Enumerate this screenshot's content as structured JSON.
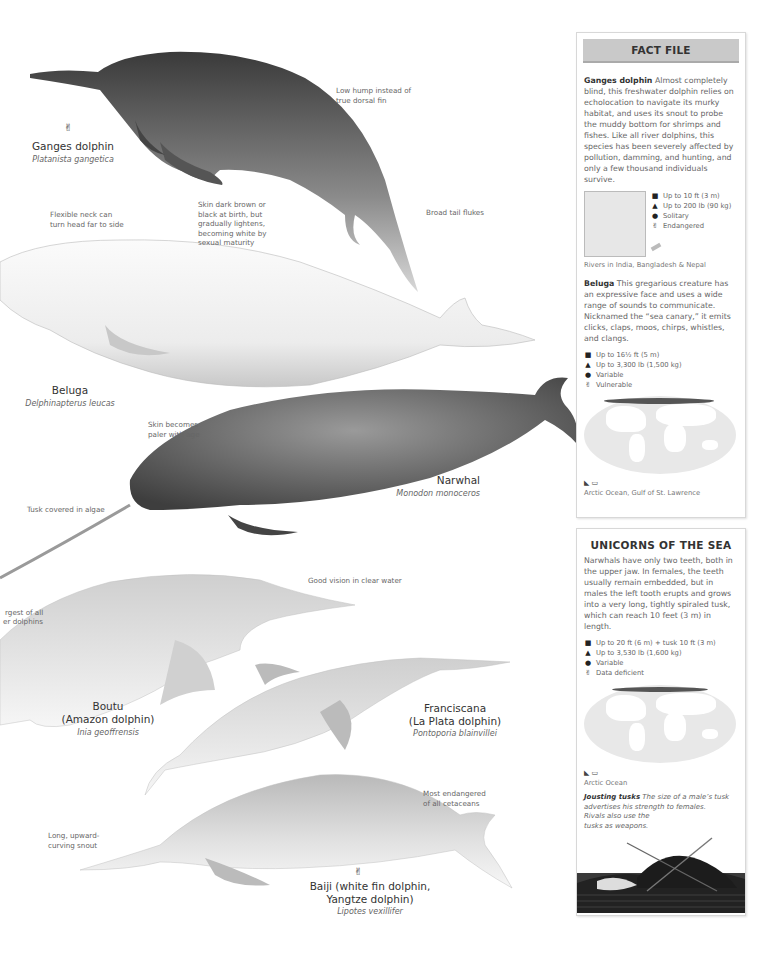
{
  "animals": {
    "ganges": {
      "common_name": "Ganges dolphin",
      "scientific_name": "Platanista gangetica",
      "status_icon": "endangered-icon",
      "annotations": [
        "Low hump instead of true dorsal fin",
        "Broad tail flukes"
      ]
    },
    "beluga": {
      "common_name": "Beluga",
      "scientific_name": "Delphinapterus leucas",
      "annotations": [
        "Flexible neck can turn head far to side",
        "Skin dark brown or black at birth, but gradually lightens, becoming white by sexual maturity"
      ]
    },
    "narwhal": {
      "common_name": "Narwhal",
      "scientific_name": "Monodon monoceros",
      "annotations": [
        "Skin becomes paler with age",
        "Tusk covered in algae"
      ]
    },
    "boutu": {
      "common_name_line1": "Boutu",
      "common_name_line2": "(Amazon dolphin)",
      "scientific_name": "Inia geoffrensis",
      "annotations": [
        "rgest of all",
        "er dolphins",
        "Good vision in clear water"
      ]
    },
    "franciscana": {
      "common_name_line1": "Franciscana",
      "common_name_line2": "(La Plata dolphin)",
      "scientific_name": "Pontoporia blainvillei"
    },
    "baiji": {
      "common_name_line1": "Baiji (white fin dolphin,",
      "common_name_line2": "Yangtze dolphin)",
      "scientific_name": "Lipotes vexillifer",
      "status_icon": "endangered-icon",
      "annotations": [
        "Most endangered of all cetaceans",
        "Long, upward-curving snout"
      ]
    }
  },
  "fact_file": {
    "title": "FACT FILE",
    "ganges": {
      "name": "Ganges dolphin",
      "text": "Almost completely blind, this freshwater dolphin relies on echolocation to navigate its murky habitat, and uses its snout to probe the muddy bottom for shrimps and fishes. Like all river dolphins, this species has been severely affected by pollution, damming, and hunting, and only a few thousand individuals survive.",
      "facts": [
        {
          "icon": "length-icon",
          "text": "Up to 10 ft (3 m)"
        },
        {
          "icon": "weight-icon",
          "text": "Up to 200 lb (90 kg)"
        },
        {
          "icon": "group-icon",
          "text": "Solitary"
        },
        {
          "icon": "status-icon",
          "text": "Endangered"
        }
      ],
      "range": "Rivers in India, Bangladesh & Nepal"
    },
    "beluga": {
      "name": "Beluga",
      "text": "This gregarious creature has an expressive face and uses a wide range of sounds to communicate. Nicknamed the “sea canary,” it emits clicks, claps, moos, chirps, whistles, and clangs.",
      "facts": [
        {
          "icon": "length-icon",
          "text": "Up to 16½ ft (5 m)"
        },
        {
          "icon": "weight-icon",
          "text": "Up to 3,300 lb (1,500 kg)"
        },
        {
          "icon": "group-icon",
          "text": "Variable"
        },
        {
          "icon": "status-icon",
          "text": "Vulnerable"
        }
      ],
      "range": "Arctic Ocean, Gulf of St. Lawrence"
    }
  },
  "unicorns": {
    "title": "UNICORNS OF THE SEA",
    "text": "Narwhals have only two teeth, both in the upper jaw. In females, the teeth usually remain embedded, but in males the left tooth erupts and grows into a very long, tightly spiraled tusk, which can reach 10 feet (3 m) in length.",
    "facts": [
      {
        "icon": "length-icon",
        "text": "Up to 20 ft (6 m) + tusk 10 ft (3 m)"
      },
      {
        "icon": "weight-icon",
        "text": "Up to 3,530 lb (1,600 kg)"
      },
      {
        "icon": "group-icon",
        "text": "Variable"
      },
      {
        "icon": "status-icon",
        "text": "Data deficient"
      }
    ],
    "range": "Arctic Ocean",
    "jousting_title": "Jousting tusks",
    "jousting_text_1": "The size of a male’s tusk advertises his strength to females.",
    "jousting_text_2": "Rivals also use the",
    "jousting_text_3": "tusks as weapons."
  },
  "icons": {
    "length": "■",
    "weight": "▲",
    "group": "❦",
    "status": "†"
  }
}
